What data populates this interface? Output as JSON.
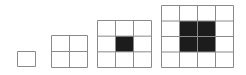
{
  "diagram": {
    "line_color": "#8a8a8a",
    "fill_color": "#1c1c1c",
    "figures": [
      {
        "n": 1,
        "x": 17,
        "y": 51,
        "w": 18,
        "h": 15,
        "shaded": null
      },
      {
        "n": 2,
        "x": 51,
        "y": 35,
        "w": 36,
        "h": 32,
        "shaded": null
      },
      {
        "n": 3,
        "x": 97,
        "y": 20,
        "w": 54,
        "h": 47,
        "shaded": {
          "col": 1,
          "row": 1,
          "size": 1
        }
      },
      {
        "n": 4,
        "x": 161,
        "y": 5,
        "w": 72,
        "h": 62,
        "shaded": {
          "col": 1,
          "row": 1,
          "size": 2
        }
      }
    ]
  }
}
